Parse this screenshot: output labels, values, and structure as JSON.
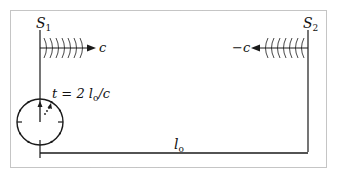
{
  "diagram": {
    "frame": {
      "style": "dotted",
      "color": "#8a8a8a"
    },
    "line_color": "#1a1a1a",
    "sources": [
      {
        "id": "S1",
        "label": "S",
        "subscript": "1",
        "velocity_label": "c",
        "direction": "right"
      },
      {
        "id": "S2",
        "label": "S",
        "subscript": "2",
        "velocity_label": "−c",
        "direction": "left"
      }
    ],
    "clock": {
      "label": "t = 2 l",
      "label_sub": "o",
      "label_tail": "/c"
    },
    "distance": {
      "label": "l",
      "subscript": "o"
    }
  }
}
